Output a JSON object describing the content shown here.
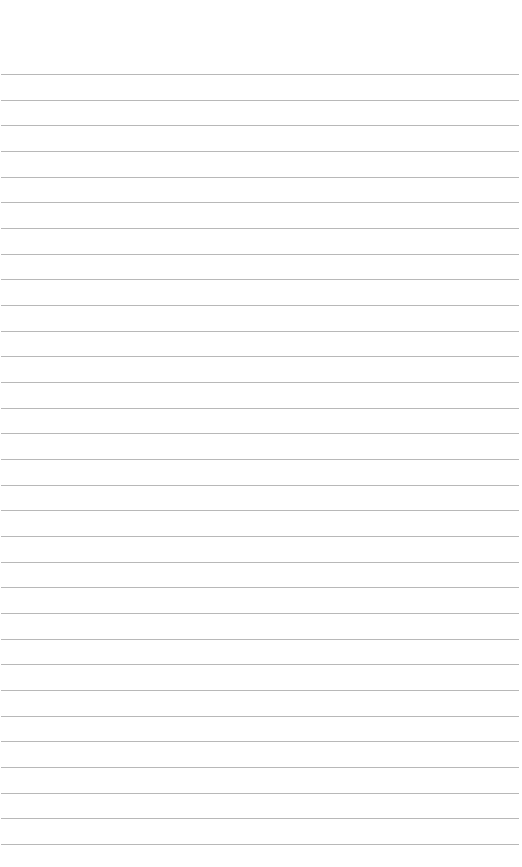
{
  "page": {
    "type": "blank lined paper",
    "background_color": "#ffffff",
    "line_color": "#b8b8b8",
    "line_count": 31,
    "first_line_y": 74,
    "line_spacing": 25.67,
    "text_content": ""
  }
}
